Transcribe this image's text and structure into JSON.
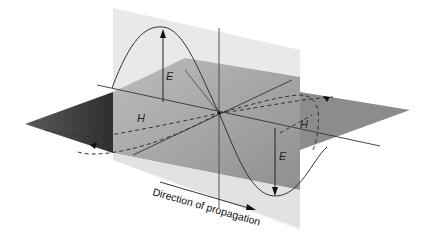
{
  "diagram": {
    "type": "electromagnetic-wave-3d",
    "labels": {
      "electric_field_top": "E",
      "magnetic_field_left": "H",
      "magnetic_field_right": "H",
      "electric_field_bottom": "E"
    },
    "caption": "Direction of propagation",
    "colors": {
      "background": "#ffffff",
      "vertical_plane": "#e6e6e6",
      "horizontal_plane_mid": "#9a9a9a",
      "horizontal_plane_dark": "#3c3c3c",
      "curve": "#333333"
    }
  }
}
